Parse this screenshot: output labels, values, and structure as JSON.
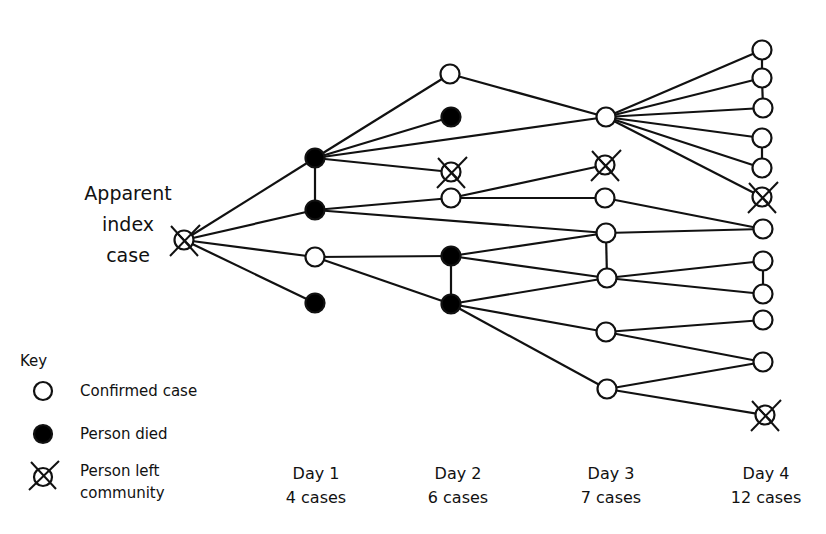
{
  "index_case": {
    "label_lines": [
      "Apparent",
      "index",
      "case"
    ]
  },
  "key": {
    "title": "Key",
    "items": [
      {
        "symbol": "open-circle",
        "label": "Confirmed case"
      },
      {
        "symbol": "filled-circle",
        "label": "Person died"
      },
      {
        "symbol": "crossed-circle",
        "label": "Person left",
        "label2": "community"
      }
    ]
  },
  "days": [
    {
      "label": "Day 1",
      "cases": "4 cases"
    },
    {
      "label": "Day 2",
      "cases": "6 cases"
    },
    {
      "label": "Day 3",
      "cases": "7 cases"
    },
    {
      "label": "Day 4",
      "cases": "12 cases"
    }
  ],
  "colors": {
    "stroke": "#111111",
    "fill_died": "#000000",
    "fill_confirmed": "#ffffff",
    "background": "#ffffff"
  },
  "network": {
    "nodes": [
      {
        "id": "index",
        "x": 184,
        "y": 240,
        "status": "left",
        "day": 0
      },
      {
        "id": "A",
        "x": 315,
        "y": 158,
        "status": "died",
        "day": 1
      },
      {
        "id": "B",
        "x": 315,
        "y": 210,
        "status": "died",
        "day": 1
      },
      {
        "id": "C",
        "x": 315,
        "y": 257,
        "status": "confirmed",
        "day": 1
      },
      {
        "id": "D",
        "x": 315,
        "y": 303,
        "status": "died",
        "day": 1
      },
      {
        "id": "E",
        "x": 450,
        "y": 74,
        "status": "confirmed",
        "day": 2
      },
      {
        "id": "F",
        "x": 451,
        "y": 117,
        "status": "died",
        "day": 2
      },
      {
        "id": "G",
        "x": 451,
        "y": 172,
        "status": "left",
        "day": 2
      },
      {
        "id": "H",
        "x": 451,
        "y": 198,
        "status": "confirmed",
        "day": 2
      },
      {
        "id": "I",
        "x": 451,
        "y": 256,
        "status": "died",
        "day": 2
      },
      {
        "id": "J",
        "x": 451,
        "y": 304,
        "status": "died",
        "day": 2
      },
      {
        "id": "K",
        "x": 606,
        "y": 117,
        "status": "confirmed",
        "day": 3
      },
      {
        "id": "L",
        "x": 605,
        "y": 165,
        "status": "left",
        "day": 3
      },
      {
        "id": "M",
        "x": 605,
        "y": 198,
        "status": "confirmed",
        "day": 3
      },
      {
        "id": "N",
        "x": 606,
        "y": 233,
        "status": "confirmed",
        "day": 3
      },
      {
        "id": "O",
        "x": 607,
        "y": 278,
        "status": "confirmed",
        "day": 3
      },
      {
        "id": "P",
        "x": 606,
        "y": 332,
        "status": "confirmed",
        "day": 3
      },
      {
        "id": "Q",
        "x": 607,
        "y": 389,
        "status": "confirmed",
        "day": 3
      },
      {
        "id": "R1",
        "x": 762,
        "y": 50,
        "status": "confirmed",
        "day": 4
      },
      {
        "id": "R2",
        "x": 762,
        "y": 78,
        "status": "confirmed",
        "day": 4
      },
      {
        "id": "R3",
        "x": 763,
        "y": 108,
        "status": "confirmed",
        "day": 4
      },
      {
        "id": "R4",
        "x": 762,
        "y": 138,
        "status": "confirmed",
        "day": 4
      },
      {
        "id": "R5",
        "x": 762,
        "y": 168,
        "status": "confirmed",
        "day": 4
      },
      {
        "id": "R6",
        "x": 762,
        "y": 197,
        "status": "left",
        "day": 4
      },
      {
        "id": "R7",
        "x": 763,
        "y": 229,
        "status": "confirmed",
        "day": 4
      },
      {
        "id": "R8",
        "x": 763,
        "y": 261,
        "status": "confirmed",
        "day": 4
      },
      {
        "id": "R9",
        "x": 763,
        "y": 294,
        "status": "confirmed",
        "day": 4
      },
      {
        "id": "R10",
        "x": 763,
        "y": 320,
        "status": "confirmed",
        "day": 4
      },
      {
        "id": "R11",
        "x": 763,
        "y": 362,
        "status": "confirmed",
        "day": 4
      },
      {
        "id": "R12",
        "x": 765,
        "y": 415,
        "status": "left",
        "day": 4
      }
    ],
    "edges": [
      [
        "index",
        "A"
      ],
      [
        "index",
        "B"
      ],
      [
        "index",
        "C"
      ],
      [
        "index",
        "D"
      ],
      [
        "A",
        "B"
      ],
      [
        "A",
        "E"
      ],
      [
        "A",
        "F"
      ],
      [
        "A",
        "K"
      ],
      [
        "A",
        "G"
      ],
      [
        "B",
        "H"
      ],
      [
        "B",
        "N"
      ],
      [
        "C",
        "I"
      ],
      [
        "C",
        "J"
      ],
      [
        "I",
        "J"
      ],
      [
        "E",
        "K"
      ],
      [
        "H",
        "L"
      ],
      [
        "H",
        "M"
      ],
      [
        "I",
        "N"
      ],
      [
        "I",
        "O"
      ],
      [
        "J",
        "O"
      ],
      [
        "J",
        "P"
      ],
      [
        "J",
        "Q"
      ],
      [
        "N",
        "O"
      ],
      [
        "K",
        "R1"
      ],
      [
        "K",
        "R2"
      ],
      [
        "K",
        "R3"
      ],
      [
        "K",
        "R4"
      ],
      [
        "K",
        "R5"
      ],
      [
        "K",
        "R6"
      ],
      [
        "M",
        "R7"
      ],
      [
        "N",
        "R7"
      ],
      [
        "O",
        "R8"
      ],
      [
        "O",
        "R9"
      ],
      [
        "P",
        "R10"
      ],
      [
        "P",
        "R11"
      ],
      [
        "Q",
        "R11"
      ],
      [
        "Q",
        "R12"
      ],
      [
        "R1",
        "R2"
      ],
      [
        "R2",
        "R3"
      ],
      [
        "R4",
        "R5"
      ],
      [
        "R8",
        "R9"
      ]
    ]
  }
}
